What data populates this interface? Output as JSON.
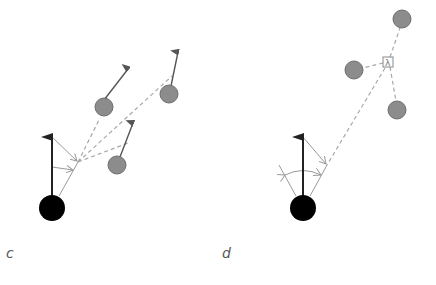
{
  "colors": {
    "agent": "#000000",
    "neighbor_fill": "#8c8c8c",
    "neighbor_stroke": "#6e6e6e",
    "heading_arrow": "#222222",
    "neighbor_arrow": "#555555",
    "dashed_line": "#a8a8a8",
    "thin_line": "#9a9a9a",
    "label": "#555555"
  },
  "panels": [
    {
      "label": "c",
      "label_pos": [
        6,
        258
      ],
      "agent": {
        "cx": 52,
        "cy": 208,
        "r": 13
      },
      "heading_arrow": {
        "x1": 52,
        "y1": 195,
        "x2": 52,
        "y2": 137
      },
      "focal_point": [
        78,
        162
      ],
      "neighbors": [
        {
          "cx": 104,
          "cy": 107,
          "r": 9,
          "arrow_tip": [
            128,
            69
          ],
          "dash_target": [
            100,
            118
          ]
        },
        {
          "cx": 169,
          "cy": 94,
          "r": 9,
          "arrow_tip": [
            178,
            52
          ],
          "dash_target": [
            172,
            76
          ]
        },
        {
          "cx": 117,
          "cy": 165,
          "r": 9,
          "arrow_tip": [
            133,
            123
          ],
          "dash_target": [
            128,
            143
          ]
        }
      ]
    },
    {
      "label": "d",
      "label_pos": [
        222,
        258
      ],
      "agent": {
        "cx": 303,
        "cy": 208,
        "r": 13
      },
      "heading_arrow": {
        "x1": 303,
        "y1": 195,
        "x2": 303,
        "y2": 137
      },
      "focal_point": [
        327,
        165
      ],
      "centroid_box": {
        "cx": 388,
        "cy": 62,
        "size": 10,
        "glyph": "λ"
      },
      "neighbors": [
        {
          "cx": 354,
          "cy": 70,
          "r": 9
        },
        {
          "cx": 402,
          "cy": 19,
          "r": 9
        },
        {
          "cx": 397,
          "cy": 110,
          "r": 9
        }
      ]
    }
  ]
}
